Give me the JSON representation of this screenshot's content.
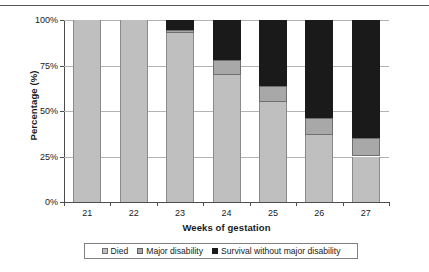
{
  "chart_data": {
    "type": "bar",
    "stacked": true,
    "stacked_mode": "percent",
    "title": "",
    "xlabel": "Weeks of gestation",
    "ylabel": "Percentage (%)",
    "categories": [
      "21",
      "22",
      "23",
      "24",
      "25",
      "26",
      "27"
    ],
    "ylim": [
      0,
      100
    ],
    "yticks": [
      0,
      25,
      50,
      75,
      100
    ],
    "ytick_labels": [
      "0%",
      "25%",
      "50%",
      "75%",
      "100%"
    ],
    "grid": true,
    "grid_axis": "y",
    "legend_position": "bottom",
    "series": [
      {
        "name": "Died",
        "color": "#bfbfbf",
        "values": [
          100,
          100,
          93,
          70,
          55,
          37,
          25
        ]
      },
      {
        "name": "Major disability",
        "color": "#a8a8a8",
        "values": [
          0,
          0,
          1.5,
          8,
          9,
          9,
          10
        ]
      },
      {
        "name": "Survival without major disability",
        "color": "#1a1a1a",
        "values": [
          0,
          0,
          5.5,
          22,
          36,
          54,
          65
        ]
      }
    ]
  },
  "legend": {
    "entries": [
      {
        "label": "Died",
        "swatch": "died-swatch"
      },
      {
        "label": "Major disability",
        "swatch": "major-disability-swatch"
      },
      {
        "label": "Survival without major disability",
        "swatch": "survival-swatch"
      }
    ]
  }
}
